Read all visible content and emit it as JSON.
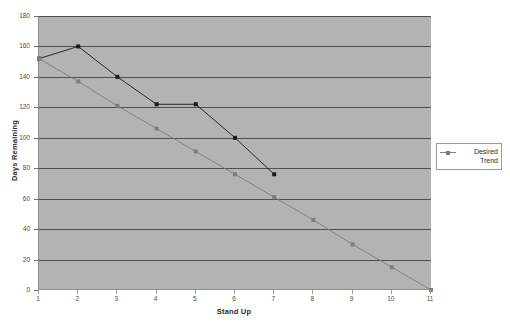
{
  "chart_data": {
    "type": "line",
    "title": "",
    "xlabel": "Stand Up",
    "ylabel": "Days Remaining",
    "xlim": [
      1,
      11
    ],
    "ylim": [
      0,
      180
    ],
    "y_ticks": [
      0,
      20,
      40,
      60,
      80,
      100,
      120,
      140,
      160,
      180
    ],
    "x_ticks": [
      1,
      2,
      3,
      4,
      5,
      6,
      7,
      8,
      9,
      10,
      11
    ],
    "grid": "horizontal",
    "legend_position": "right",
    "plot_background": "#b3b3b3",
    "series": [
      {
        "name": "Actual",
        "color": "#1a1a1a",
        "marker": "square",
        "show_in_legend": false,
        "x": [
          1,
          2,
          3,
          4,
          5,
          6,
          7
        ],
        "values": [
          152,
          160,
          140,
          122,
          122,
          100,
          76
        ]
      },
      {
        "name": "Desired Trend",
        "color": "#7d7d7d",
        "marker": "square",
        "show_in_legend": true,
        "x": [
          1,
          2,
          3,
          4,
          5,
          6,
          7,
          8,
          9,
          10,
          11
        ],
        "values": [
          152,
          137,
          121,
          106,
          91,
          76,
          61,
          46,
          30,
          15,
          0
        ]
      }
    ]
  },
  "legend": {
    "entries": [
      {
        "label_line1": "Desired",
        "label_line2": "Trend",
        "color": "#7d7d7d"
      }
    ]
  },
  "axes": {
    "y_tick_labels": [
      "180",
      "160",
      "140",
      "120",
      "100",
      "80",
      "60",
      "40",
      "20",
      "0"
    ],
    "x_tick_labels": [
      "1",
      "2",
      "3",
      "4",
      "5",
      "6",
      "7",
      "8",
      "9",
      "10",
      "11"
    ],
    "y_title": "Days Remaining",
    "x_title": "Stand Up"
  }
}
